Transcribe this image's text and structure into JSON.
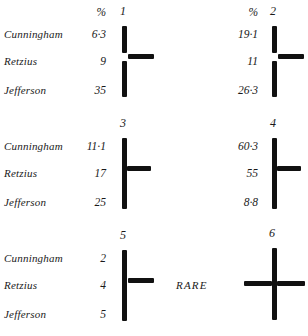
{
  "figure": {
    "type": "anatomical-cross-diagram-grid",
    "row_names": [
      "Cunningham",
      "Retzius",
      "Jefferson"
    ],
    "percent_header": "%",
    "rare_label": "RARE"
  },
  "panels": [
    {
      "number": "1",
      "show_percent_header": true,
      "show_names": true,
      "values": [
        "6·3",
        "9",
        "35"
      ],
      "cross": {
        "vertical": "split",
        "arms": [
          "right"
        ]
      }
    },
    {
      "number": "2",
      "show_percent_header": true,
      "show_names": false,
      "values": [
        "19·1",
        "11",
        "26·3"
      ],
      "cross": {
        "vertical": "split",
        "arms": [
          "right"
        ]
      }
    },
    {
      "number": "3",
      "show_percent_header": false,
      "show_names": true,
      "values": [
        "11·1",
        "17",
        "25"
      ],
      "cross": {
        "vertical": "continuous",
        "arms": [
          "right"
        ]
      }
    },
    {
      "number": "4",
      "show_percent_header": false,
      "show_names": false,
      "values": [
        "60·3",
        "55",
        "8·8"
      ],
      "cross": {
        "vertical": "continuous",
        "arms": [
          "right"
        ]
      }
    },
    {
      "number": "5",
      "show_percent_header": false,
      "show_names": true,
      "values": [
        "2",
        "4",
        "5"
      ],
      "cross": {
        "vertical": "split",
        "arms": [
          "right"
        ]
      }
    },
    {
      "number": "6",
      "show_percent_header": false,
      "show_names": false,
      "rare": true,
      "values": [
        "",
        "",
        ""
      ],
      "cross": {
        "vertical": "continuous",
        "arms": [
          "left",
          "right"
        ]
      }
    }
  ],
  "chart_data": {
    "type": "table",
    "title": "",
    "columns": [
      "Observer",
      "1",
      "2",
      "3",
      "4",
      "5",
      "6"
    ],
    "rows": [
      {
        "observer": "Cunningham",
        "values": [
          "6·3",
          "19·1",
          "11·1",
          "60·3",
          "2",
          ""
        ]
      },
      {
        "observer": "Retzius",
        "values": [
          "9",
          "11",
          "17",
          "55",
          "4",
          ""
        ]
      },
      {
        "observer": "Jefferson",
        "values": [
          "35",
          "26·3",
          "25",
          "8·8",
          "5",
          ""
        ]
      }
    ],
    "units": "%",
    "legend": [],
    "xlabel": "",
    "ylabel": ""
  }
}
